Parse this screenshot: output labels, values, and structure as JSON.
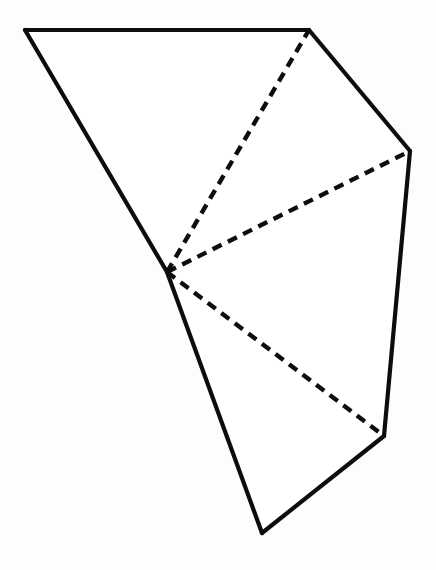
{
  "figure": {
    "canvas": {
      "width": 436,
      "height": 570,
      "background_color": "#fdfdfd"
    },
    "style": {
      "line_color": "#0d0d0d",
      "solid_stroke_width": 4.2,
      "dashed_stroke_width": 4.4,
      "dash_length": 10,
      "dash_gap": 7,
      "face_fill_color": "#ffffff"
    },
    "vertices": [
      {
        "id": "A",
        "name": "top-left-vertex",
        "x": 25,
        "y": 30
      },
      {
        "id": "B",
        "name": "top-right-vertex",
        "x": 309,
        "y": 30
      },
      {
        "id": "C",
        "name": "right-vertex",
        "x": 410,
        "y": 151
      },
      {
        "id": "D",
        "name": "lower-right-vertex",
        "x": 384,
        "y": 436
      },
      {
        "id": "E",
        "name": "bottom-vertex",
        "x": 262,
        "y": 533
      },
      {
        "id": "F",
        "name": "apex-vertex",
        "x": 167,
        "y": 272
      }
    ],
    "solid_edges": [
      {
        "name": "top-edge",
        "from": "A",
        "to": "B"
      },
      {
        "name": "upper-right-edge",
        "from": "B",
        "to": "C"
      },
      {
        "name": "right-edge",
        "from": "C",
        "to": "D"
      },
      {
        "name": "lower-right-edge",
        "from": "D",
        "to": "E"
      },
      {
        "name": "lower-left-edge",
        "from": "E",
        "to": "F"
      },
      {
        "name": "upper-left-edge",
        "from": "F",
        "to": "A"
      }
    ],
    "dashed_edges": [
      {
        "name": "fold-line-apex-to-top-right",
        "from": "F",
        "to": "B"
      },
      {
        "name": "fold-line-apex-to-right",
        "from": "F",
        "to": "C"
      },
      {
        "name": "fold-line-apex-to-lower-right",
        "from": "F",
        "to": "D"
      }
    ],
    "outline_path": "M 25 30 L 309 30 L 410 151 L 384 436 L 262 533 L 167 272 Z",
    "labels": []
  }
}
